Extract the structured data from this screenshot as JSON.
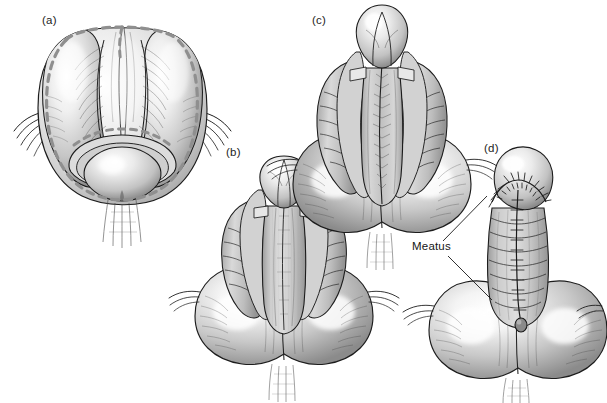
{
  "figure": {
    "background_color": "#ffffff",
    "ink_color": "#1a1a1a",
    "label_color": "#232323",
    "marking_color": "#8f8f8f",
    "width": 607,
    "height": 403,
    "style": "grayscale medical line illustration with airbrush shading"
  },
  "panels": [
    {
      "id": "a",
      "label": "(a)",
      "label_x": 42,
      "label_y": 24,
      "description": "ventral view with dashed planned incision outline around glans and shaft"
    },
    {
      "id": "b",
      "label": "(b)",
      "label_x": 226,
      "label_y": 156,
      "description": "degloved shaft with mobilized urethral plate and lateral flaps"
    },
    {
      "id": "c",
      "label": "(c)",
      "label_x": 312,
      "label_y": 24,
      "description": "further dissection showing glans wings and urethral plate"
    },
    {
      "id": "d",
      "label": "(d)",
      "label_x": 484,
      "label_y": 152,
      "description": "completed repair with midline suture line and sutured glans"
    }
  ],
  "callouts": [
    {
      "text": "Meatus",
      "x": 412,
      "y": 250,
      "leaders": [
        {
          "from_x": 443,
          "from_y": 241,
          "to_x": 487,
          "to_y": 196
        },
        {
          "from_x": 448,
          "from_y": 256,
          "to_x": 492,
          "to_y": 300
        }
      ]
    }
  ],
  "caption": {
    "clipped_text": ""
  },
  "colors": {
    "ink": "#1a1a1a",
    "dashed_marking": "#8f8f8f",
    "tissue_light": "#f2f2f2",
    "tissue_mid": "#c9c9c9",
    "tissue_dark": "#8a8a8a",
    "highlight": "#ffffff",
    "text": "#232323"
  }
}
